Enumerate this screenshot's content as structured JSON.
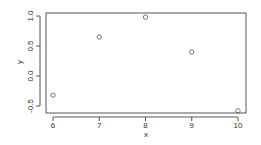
{
  "chart_data": {
    "type": "scatter",
    "title": "",
    "xlabel": "x",
    "ylabel": "y",
    "x": [
      6,
      7,
      8,
      9,
      10
    ],
    "y": [
      -0.32,
      0.65,
      0.98,
      0.4,
      -0.58
    ],
    "xlim": [
      5.85,
      10.15
    ],
    "ylim": [
      -0.62,
      1.05
    ],
    "xticks": [
      "6",
      "7",
      "8",
      "9",
      "10"
    ],
    "yticks": [
      "-0.5",
      "0.0",
      "0.5",
      "1.0"
    ],
    "grid": false,
    "legend": null,
    "marker": "open-circle",
    "colors": {
      "axis": "#555555",
      "marker": "#555555",
      "text": "#333333",
      "background": "#ffffff"
    }
  }
}
